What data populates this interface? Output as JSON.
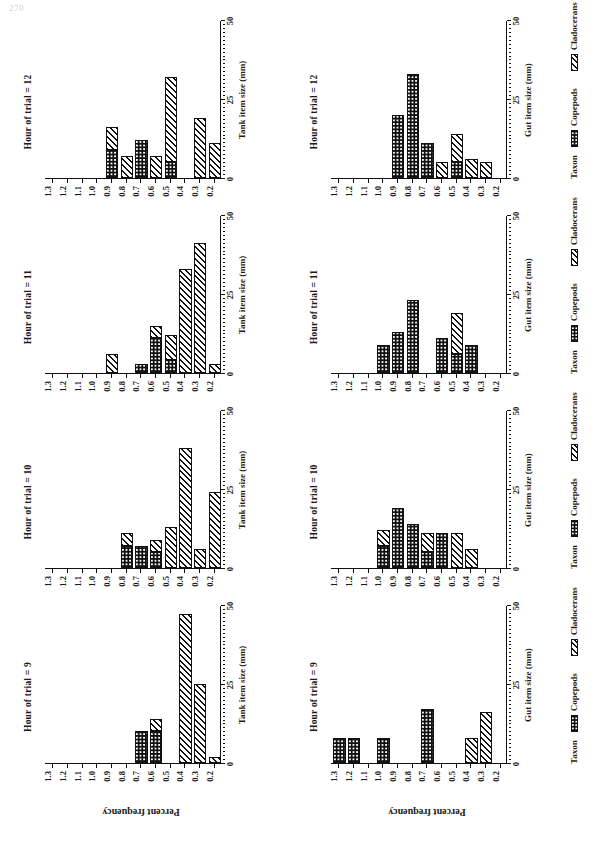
{
  "page": {
    "number": "270"
  },
  "figure": {
    "y_axis_title": "Percent frequency",
    "y_ticks": [
      "0",
      "25",
      "50"
    ],
    "y_tick_values": [
      0,
      25,
      50
    ],
    "ylim": [
      0,
      50
    ],
    "legend": {
      "title": "Taxon",
      "items": [
        {
          "label": "Copepods",
          "pattern": "checkerboard"
        },
        {
          "label": "Cladocerans",
          "pattern": "diagonal-hatch"
        }
      ]
    },
    "categories": [
      "0.2",
      "0.3",
      "0.4",
      "0.5",
      "0.6",
      "0.7",
      "0.8",
      "0.9",
      "1.0",
      "1.1",
      "1.2",
      "1.3"
    ],
    "row_axis_titles": {
      "top": "Tank item size (mm)",
      "bottom": "Gut item size (mm)"
    },
    "panel_titles": [
      "Hour of trial = 9",
      "Hour of trial = 10",
      "Hour of trial = 11",
      "Hour of trial = 12"
    ]
  },
  "chart_data": {
    "type": "bar",
    "title": "",
    "xlabel": "Item size (mm)",
    "ylabel": "Percent frequency",
    "ylim": [
      0,
      50
    ],
    "grid": false,
    "legend_position": "bottom-right",
    "categories": [
      "0.2",
      "0.3",
      "0.4",
      "0.5",
      "0.6",
      "0.7",
      "0.8",
      "0.9",
      "1.0",
      "1.1",
      "1.2",
      "1.3"
    ],
    "panels": [
      {
        "panel_title": "Hour of trial = 9",
        "row": "tank",
        "xlabel": "Tank item size (mm)",
        "series": [
          {
            "name": "Copepods",
            "values": [
              0,
              0,
              0,
              0,
              10,
              10,
              0,
              0,
              0,
              0,
              0,
              0
            ]
          },
          {
            "name": "Cladocerans",
            "values": [
              2,
              25,
              47,
              0,
              4,
              0,
              0,
              0,
              0,
              0,
              0,
              0
            ]
          }
        ]
      },
      {
        "panel_title": "Hour of trial = 10",
        "row": "tank",
        "xlabel": "Tank item size (mm)",
        "series": [
          {
            "name": "Copepods",
            "values": [
              0,
              0,
              0,
              0,
              5,
              7,
              7,
              0,
              0,
              0,
              0,
              0
            ]
          },
          {
            "name": "Cladocerans",
            "values": [
              24,
              6,
              38,
              13,
              4,
              0,
              4,
              0,
              0,
              0,
              0,
              0
            ]
          }
        ]
      },
      {
        "panel_title": "Hour of trial = 11",
        "row": "tank",
        "xlabel": "Tank item size (mm)",
        "series": [
          {
            "name": "Copepods",
            "values": [
              0,
              0,
              0,
              4,
              11,
              3,
              0,
              0,
              0,
              0,
              0,
              0
            ]
          },
          {
            "name": "Cladocerans",
            "values": [
              3,
              41,
              33,
              8,
              4,
              0,
              0,
              6,
              0,
              0,
              0,
              0
            ]
          }
        ]
      },
      {
        "panel_title": "Hour of trial = 12",
        "row": "tank",
        "xlabel": "Tank item size (mm)",
        "series": [
          {
            "name": "Copepods",
            "values": [
              0,
              0,
              0,
              5,
              0,
              12,
              0,
              9,
              0,
              0,
              0,
              0
            ]
          },
          {
            "name": "Cladocerans",
            "values": [
              11,
              19,
              0,
              27,
              7,
              0,
              7,
              7,
              0,
              0,
              0,
              0
            ]
          }
        ]
      },
      {
        "panel_title": "Hour of trial = 9",
        "row": "gut",
        "xlabel": "Gut item size (mm)",
        "series": [
          {
            "name": "Copepods",
            "values": [
              0,
              0,
              0,
              0,
              0,
              17,
              0,
              0,
              8,
              0,
              8,
              8
            ]
          },
          {
            "name": "Cladocerans",
            "values": [
              0,
              16,
              8,
              0,
              0,
              0,
              0,
              0,
              0,
              0,
              0,
              0
            ]
          }
        ]
      },
      {
        "panel_title": "Hour of trial = 10",
        "row": "gut",
        "xlabel": "Gut item size (mm)",
        "series": [
          {
            "name": "Copepods",
            "values": [
              0,
              0,
              0,
              0,
              11,
              5,
              14,
              19,
              7,
              0,
              0,
              0
            ]
          },
          {
            "name": "Cladocerans",
            "values": [
              0,
              0,
              6,
              11,
              0,
              6,
              0,
              0,
              5,
              0,
              0,
              0
            ]
          }
        ]
      },
      {
        "panel_title": "Hour of trial = 11",
        "row": "gut",
        "xlabel": "Gut item size (mm)",
        "series": [
          {
            "name": "Copepods",
            "values": [
              0,
              0,
              9,
              6,
              11,
              0,
              23,
              13,
              9,
              0,
              0,
              0
            ]
          },
          {
            "name": "Cladocerans",
            "values": [
              0,
              0,
              0,
              13,
              0,
              0,
              0,
              0,
              0,
              0,
              0,
              0
            ]
          }
        ]
      },
      {
        "panel_title": "Hour of trial = 12",
        "row": "gut",
        "xlabel": "Gut item size (mm)",
        "series": [
          {
            "name": "Copepods",
            "values": [
              0,
              0,
              0,
              5,
              0,
              11,
              33,
              20,
              0,
              0,
              0,
              0
            ]
          },
          {
            "name": "Cladocerans",
            "values": [
              0,
              5,
              6,
              9,
              5,
              0,
              0,
              0,
              0,
              0,
              0,
              0
            ]
          }
        ]
      }
    ]
  }
}
